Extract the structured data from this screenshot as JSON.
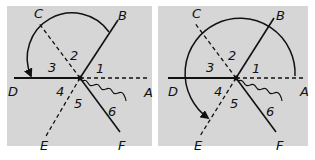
{
  "figure": {
    "panels": [
      {
        "id": "left",
        "points": {
          "A": "A",
          "B": "B",
          "C": "C",
          "D": "D",
          "E": "E",
          "F": "F"
        },
        "angles": [
          "1",
          "2",
          "3",
          "4",
          "5",
          "6"
        ],
        "arc": "curved arrow from B to D"
      },
      {
        "id": "right",
        "points": {
          "A": "A",
          "B": "B",
          "C": "C",
          "D": "D",
          "E": "E",
          "F": "F"
        },
        "angles": [
          "1",
          "2",
          "3",
          "4",
          "5",
          "6"
        ],
        "arc": "curved arrow from A around to E"
      }
    ],
    "colors": {
      "background": "#d6d6d6",
      "ink": "#111111"
    }
  }
}
